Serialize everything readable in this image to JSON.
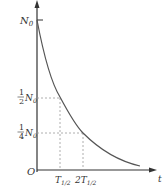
{
  "diagram": {
    "y_axis_label": "N",
    "x_axis_label": "t",
    "origin_label": "O",
    "y_ticks": [
      {
        "label_num": "",
        "label_den": "",
        "label_var": "N",
        "label_sub": "0",
        "value": 1.0
      },
      {
        "label_num": "1",
        "label_den": "2",
        "label_var": "N",
        "label_sub": "0",
        "value": 0.5
      },
      {
        "label_num": "1",
        "label_den": "4",
        "label_var": "N",
        "label_sub": "0",
        "value": 0.25
      }
    ],
    "x_ticks": [
      {
        "prefix": "",
        "label_var": "T",
        "label_sub": "1/2",
        "value": 1
      },
      {
        "prefix": "2",
        "label_var": "T",
        "label_sub": "1/2",
        "value": 2
      }
    ],
    "colors": {
      "axis": "#333333",
      "curve": "#555555",
      "dashed": "#999999"
    }
  }
}
